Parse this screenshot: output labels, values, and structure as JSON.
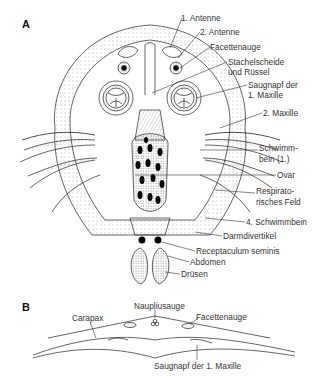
{
  "panel_a": {
    "letter": "A",
    "labels": [
      {
        "text": "1. Antenne",
        "x": 181,
        "y": 14
      },
      {
        "text": "2. Antenne",
        "x": 200,
        "y": 28
      },
      {
        "text": "Facettenauge",
        "x": 210,
        "y": 43
      },
      {
        "text": "Stachelscheide",
        "x": 228,
        "y": 58
      },
      {
        "text": "und Rüssel",
        "x": 228,
        "y": 68
      },
      {
        "text": "Saugnapf der",
        "x": 248,
        "y": 81
      },
      {
        "text": "1. Maxille",
        "x": 248,
        "y": 91
      },
      {
        "text": "2. Maxille",
        "x": 263,
        "y": 109
      },
      {
        "text": "Schwimm-",
        "x": 259,
        "y": 144
      },
      {
        "text": "bein (1.)",
        "x": 259,
        "y": 155
      },
      {
        "text": "Ovar",
        "x": 277,
        "y": 171
      },
      {
        "text": "Respirato-",
        "x": 256,
        "y": 187
      },
      {
        "text": "risches Feld",
        "x": 256,
        "y": 198
      },
      {
        "text": "4. Schwimmbein",
        "x": 246,
        "y": 218
      },
      {
        "text": "Darmdivertikel",
        "x": 223,
        "y": 232
      },
      {
        "text": "Receptaculum seminis",
        "x": 196,
        "y": 247
      },
      {
        "text": "Abdomen",
        "x": 190,
        "y": 258
      },
      {
        "text": "Drüsen",
        "x": 181,
        "y": 270
      }
    ]
  },
  "panel_b": {
    "letter": "B",
    "labels": [
      {
        "text": "Carapax",
        "x": 72,
        "y": 314
      },
      {
        "text": "Nauplius­auge",
        "x": 134,
        "y": 302
      },
      {
        "text": "Facettenauge",
        "x": 196,
        "y": 313
      },
      {
        "text": "Saugnapf der 1. Maxille",
        "x": 154,
        "y": 362
      }
    ]
  },
  "colors": {
    "ink": "#222222",
    "dot": "#000000",
    "bg": "#ffffff"
  }
}
